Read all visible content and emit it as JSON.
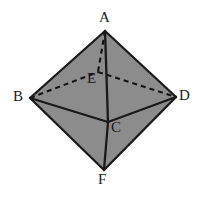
{
  "figure": {
    "name": "octahedron-diagram",
    "background_color": "#ffffff",
    "face_fill_color": "#8c8c8c",
    "edge_color": "#1a1a1a",
    "hidden_edge_color": "#141414",
    "label_color": "#1b1b1b"
  },
  "vertices": [
    {
      "id": "A",
      "label": "A",
      "x": 105,
      "y": 31,
      "label_x": 99,
      "label_y": 10,
      "hidden": false
    },
    {
      "id": "B",
      "label": "B",
      "x": 30,
      "y": 98,
      "label_x": 13,
      "label_y": 89,
      "hidden": false
    },
    {
      "id": "C",
      "label": "C",
      "x": 108,
      "y": 122,
      "label_x": 111,
      "label_y": 120,
      "hidden": false
    },
    {
      "id": "D",
      "label": "D",
      "x": 176,
      "y": 97,
      "label_x": 179,
      "label_y": 88,
      "hidden": false
    },
    {
      "id": "E",
      "label": "E",
      "x": 98,
      "y": 72,
      "label_x": 87,
      "label_y": 71,
      "hidden": true
    },
    {
      "id": "F",
      "label": "F",
      "x": 104,
      "y": 170,
      "label_x": 98,
      "label_y": 172,
      "hidden": false
    }
  ],
  "faces": [
    {
      "name": "face-A-B-C",
      "points": "105,31 30,98 108,122"
    },
    {
      "name": "face-A-C-D",
      "points": "105,31 108,122 176,97"
    },
    {
      "name": "face-B-C-F",
      "points": "30,98 108,122 104,170"
    },
    {
      "name": "face-C-D-F",
      "points": "108,122 176,97 104,170"
    },
    {
      "name": "face-A-B-E",
      "points": "105,31 30,98 98,72"
    },
    {
      "name": "face-A-E-D",
      "points": "105,31 98,72 176,97"
    }
  ],
  "edges": [
    {
      "name": "edge-A-B",
      "from": "A",
      "to": "B",
      "x1": 105,
      "y1": 31,
      "x2": 30,
      "y2": 98,
      "style": "solid"
    },
    {
      "name": "edge-A-D",
      "from": "A",
      "to": "D",
      "x1": 105,
      "y1": 31,
      "x2": 176,
      "y2": 97,
      "style": "solid"
    },
    {
      "name": "edge-B-F",
      "from": "B",
      "to": "F",
      "x1": 30,
      "y1": 98,
      "x2": 104,
      "y2": 170,
      "style": "solid"
    },
    {
      "name": "edge-D-F",
      "from": "D",
      "to": "F",
      "x1": 176,
      "y1": 97,
      "x2": 104,
      "y2": 170,
      "style": "solid"
    },
    {
      "name": "edge-A-C",
      "from": "A",
      "to": "C",
      "x1": 105,
      "y1": 31,
      "x2": 108,
      "y2": 122,
      "style": "solid"
    },
    {
      "name": "edge-C-F",
      "from": "C",
      "to": "F",
      "x1": 108,
      "y1": 122,
      "x2": 104,
      "y2": 170,
      "style": "solid"
    },
    {
      "name": "edge-B-C",
      "from": "B",
      "to": "C",
      "x1": 30,
      "y1": 98,
      "x2": 108,
      "y2": 122,
      "style": "solid"
    },
    {
      "name": "edge-C-D",
      "from": "C",
      "to": "D",
      "x1": 108,
      "y1": 122,
      "x2": 176,
      "y2": 97,
      "style": "solid"
    },
    {
      "name": "edge-A-E",
      "from": "A",
      "to": "E",
      "x1": 105,
      "y1": 31,
      "x2": 98,
      "y2": 72,
      "style": "dashed"
    },
    {
      "name": "edge-B-E",
      "from": "B",
      "to": "E",
      "x1": 30,
      "y1": 98,
      "x2": 98,
      "y2": 72,
      "style": "dashed"
    },
    {
      "name": "edge-E-D",
      "from": "E",
      "to": "D",
      "x1": 98,
      "y1": 72,
      "x2": 176,
      "y2": 97,
      "style": "dashed"
    }
  ]
}
